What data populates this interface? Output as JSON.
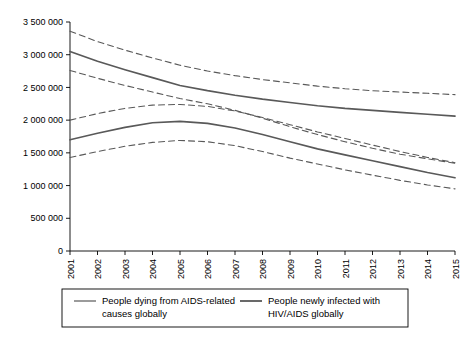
{
  "chart_data": {
    "type": "line",
    "title": "",
    "xlabel": "",
    "ylabel": "",
    "grid": false,
    "legend_position": "bottom",
    "x": [
      2001,
      2002,
      2003,
      2004,
      2005,
      2006,
      2007,
      2008,
      2009,
      2010,
      2011,
      2012,
      2013,
      2014,
      2015
    ],
    "xtick_labels": [
      "2001",
      "2002",
      "2003",
      "2004",
      "2005",
      "2006",
      "2007",
      "2008",
      "2009",
      "2010",
      "2011",
      "2012",
      "2013",
      "2014",
      "2015"
    ],
    "ytick_labels": [
      "0",
      "500 000",
      "1 000 000",
      "1 500 000",
      "2 000 000",
      "2 500 000",
      "3 000 000",
      "3 500 000"
    ],
    "ytick_values": [
      0,
      500000,
      1000000,
      1500000,
      2000000,
      2500000,
      3000000,
      3500000
    ],
    "ylim": [
      0,
      3500000
    ],
    "xlim": [
      2001,
      2015
    ],
    "series": [
      {
        "name": "People newly infected with HIV/AIDS globally",
        "style": "solid",
        "color": "#595959",
        "values": [
          3050000,
          2900000,
          2770000,
          2650000,
          2530000,
          2450000,
          2380000,
          2320000,
          2270000,
          2220000,
          2180000,
          2150000,
          2120000,
          2090000,
          2060000
        ]
      },
      {
        "name": "People newly infected with HIV/AIDS globally - upper bound",
        "style": "dashed",
        "color": "#595959",
        "values": [
          3360000,
          3200000,
          3070000,
          2950000,
          2840000,
          2750000,
          2680000,
          2620000,
          2570000,
          2520000,
          2480000,
          2450000,
          2430000,
          2410000,
          2390000
        ]
      },
      {
        "name": "People newly infected with HIV/AIDS globally - lower bound",
        "style": "dashed",
        "color": "#595959",
        "values": [
          2760000,
          2640000,
          2530000,
          2430000,
          2330000,
          2250000,
          2150000,
          2030000,
          1900000,
          1780000,
          1670000,
          1570000,
          1480000,
          1410000,
          1340000
        ]
      },
      {
        "name": "People dying from AIDS-related causes globally",
        "style": "solid",
        "color": "#595959",
        "values": [
          1700000,
          1800000,
          1890000,
          1960000,
          1980000,
          1950000,
          1880000,
          1780000,
          1670000,
          1560000,
          1470000,
          1380000,
          1290000,
          1200000,
          1120000
        ]
      },
      {
        "name": "People dying from AIDS-related causes globally - upper bound",
        "style": "dashed",
        "color": "#595959",
        "values": [
          2000000,
          2100000,
          2180000,
          2230000,
          2240000,
          2210000,
          2140000,
          2040000,
          1930000,
          1820000,
          1720000,
          1620000,
          1520000,
          1430000,
          1350000
        ]
      },
      {
        "name": "People dying from AIDS-related causes globally - lower bound",
        "style": "dashed",
        "color": "#595959",
        "values": [
          1430000,
          1520000,
          1600000,
          1660000,
          1690000,
          1670000,
          1610000,
          1520000,
          1420000,
          1330000,
          1240000,
          1160000,
          1080000,
          1010000,
          950000
        ]
      }
    ],
    "legend": [
      {
        "label_line1": "People dying from AIDS-related",
        "label_line2": "causes globally"
      },
      {
        "label_line1": "People newly infected with",
        "label_line2": "HIV/AIDS globally"
      }
    ]
  }
}
